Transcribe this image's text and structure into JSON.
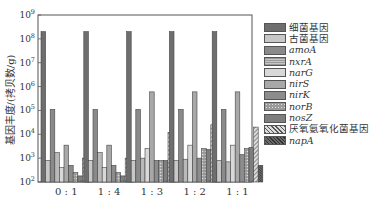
{
  "chart_data": {
    "type": "bar",
    "title": "",
    "xlabel": "",
    "ylabel": "基因丰度/(拷贝数/g)",
    "yscale": "log",
    "ylim": [
      100,
      1000000000
    ],
    "yticks": [
      "10^2",
      "10^3",
      "10^4",
      "10^5",
      "10^6",
      "10^7",
      "10^8",
      "10^9"
    ],
    "categories": [
      "0:1",
      "1:4",
      "1:3",
      "1:2",
      "1:1"
    ],
    "legend_position": "right",
    "grid": false,
    "series": [
      {
        "name": "细菌基因",
        "italic": false,
        "values": [
          200000000,
          200000000,
          200000000,
          200000000,
          200000000
        ]
      },
      {
        "name": "古菌基因",
        "italic": false,
        "values": [
          800,
          800,
          800,
          800,
          800
        ]
      },
      {
        "name": "amoA",
        "italic": true,
        "values": [
          110000,
          110000,
          110000,
          110000,
          110000
        ]
      },
      {
        "name": "nxrA",
        "italic": true,
        "values": [
          1700,
          1700,
          1000,
          900,
          700
        ]
      },
      {
        "name": "narG",
        "italic": true,
        "values": [
          400,
          400,
          2500,
          3500,
          3500
        ]
      },
      {
        "name": "nirS",
        "italic": true,
        "values": [
          3500,
          3500,
          600000,
          600000,
          600000
        ]
      },
      {
        "name": "nirK",
        "italic": true,
        "values": [
          500,
          500,
          800,
          1000,
          1400
        ]
      },
      {
        "name": "norB",
        "italic": true,
        "values": [
          250,
          250,
          800,
          2500,
          2500
        ]
      },
      {
        "name": "nosZ",
        "italic": true,
        "values": [
          180,
          180,
          800,
          2300,
          2800
        ]
      },
      {
        "name": "厌氧氨氧化菌基因",
        "italic": false,
        "values": [
          1000,
          1000,
          12000,
          25000,
          20000
        ]
      },
      {
        "name": "napA",
        "italic": true,
        "values": [
          250,
          250,
          500,
          500,
          500
        ]
      }
    ]
  },
  "legend": {
    "items": [
      {
        "label": "细菌基因",
        "italic": false
      },
      {
        "label": "古菌基因",
        "italic": false
      },
      {
        "label": "amoA",
        "italic": true
      },
      {
        "label": "nxrA",
        "italic": true
      },
      {
        "label": "narG",
        "italic": true
      },
      {
        "label": "nirS",
        "italic": true
      },
      {
        "label": "nirK",
        "italic": true
      },
      {
        "label": "norB",
        "italic": true
      },
      {
        "label": "nosZ",
        "italic": true
      },
      {
        "label": "厌氧氨氧化菌基因",
        "italic": false
      },
      {
        "label": "napA",
        "italic": true
      }
    ]
  },
  "colors": {
    "fills": [
      "#6e6e6e",
      "#c8c8c8",
      "#8a8a8a",
      "#b0b0b0",
      "#d8d8d8",
      "#a8a8a8",
      "#8c8c8c",
      "#9a9a9a",
      "#7e7e7e",
      "#bdbdbd",
      "#5a5a5a"
    ],
    "stroke": "#444444",
    "axis": "#555555"
  }
}
